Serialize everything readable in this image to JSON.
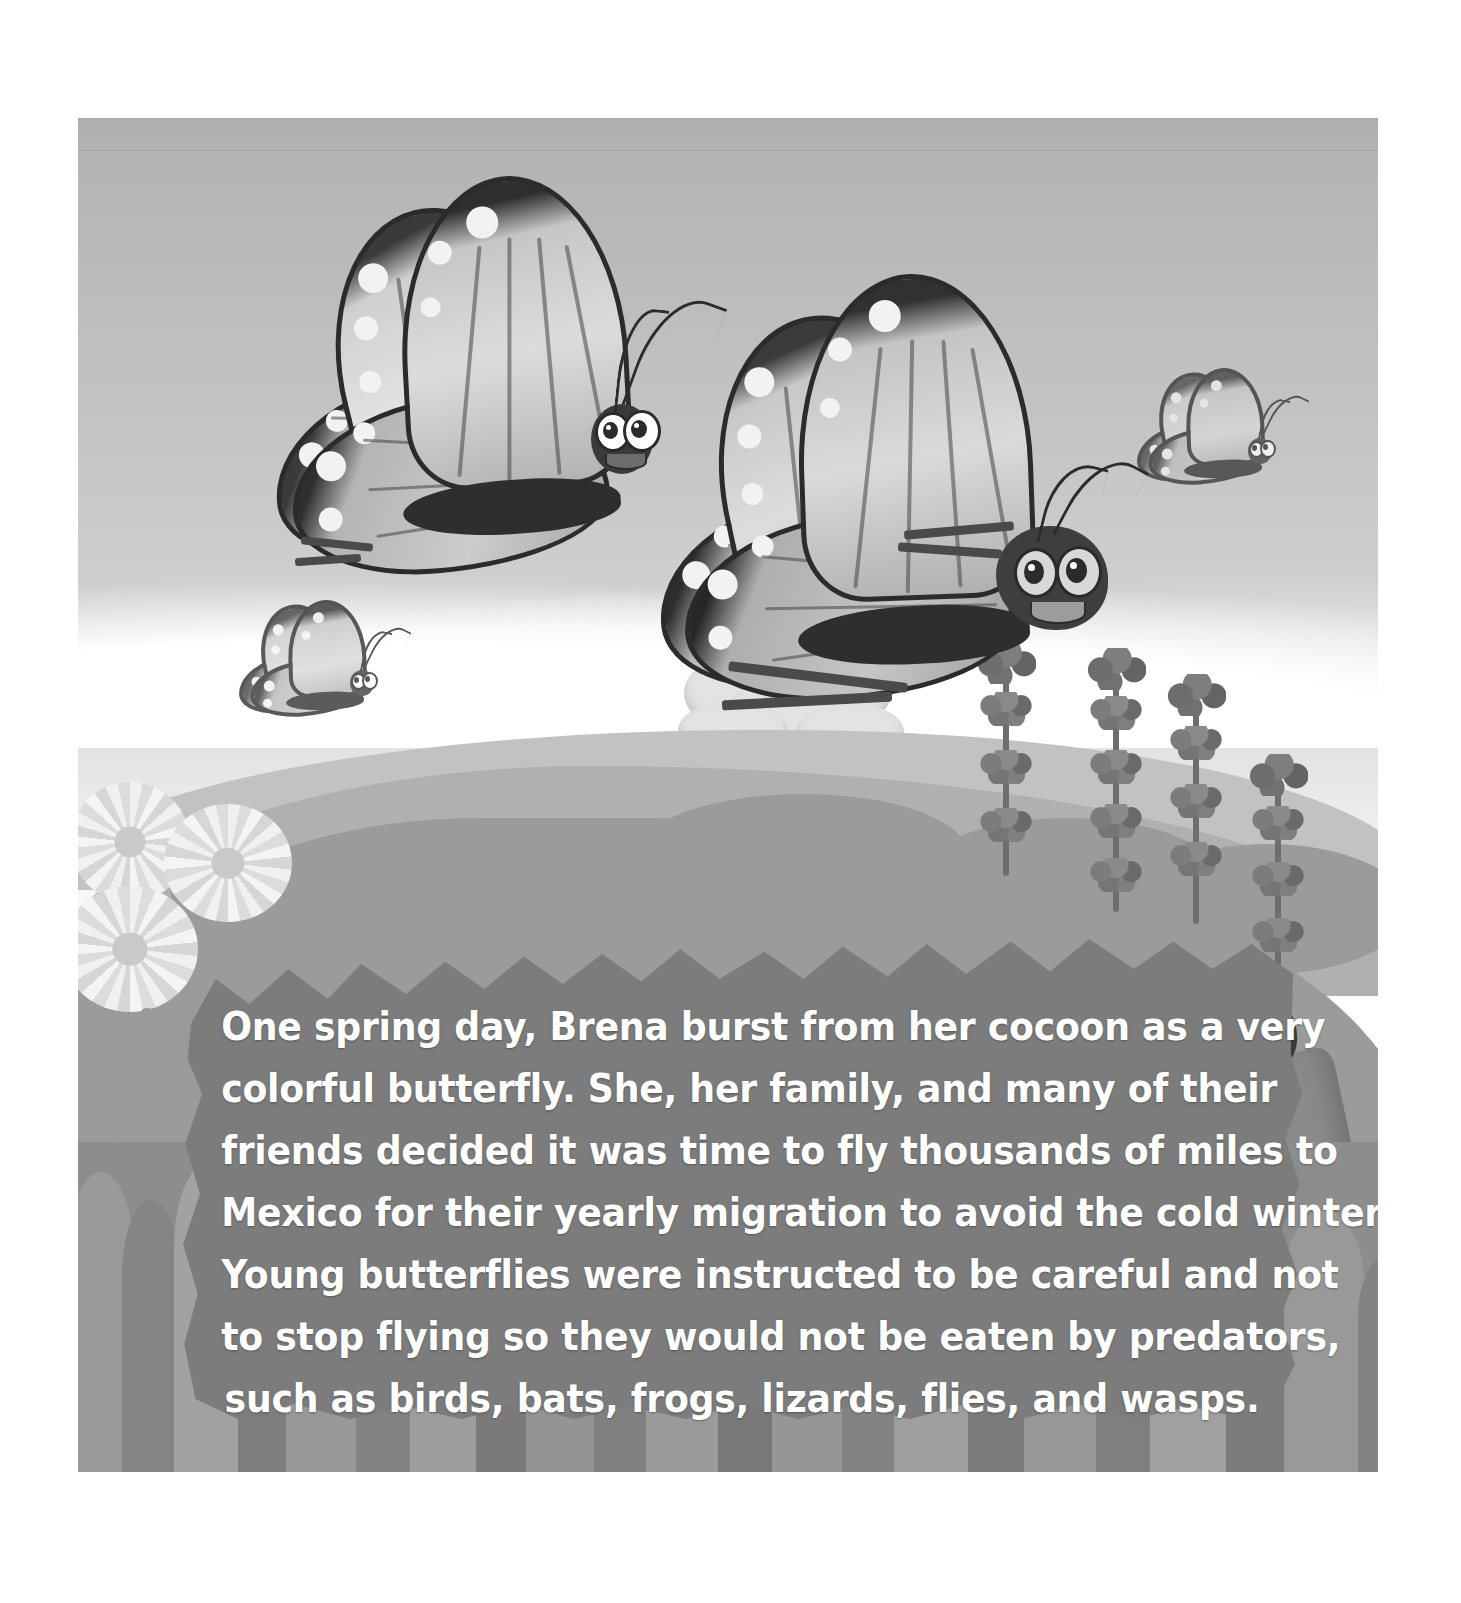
{
  "page": {
    "type": "childrens-picture-book-page",
    "canvas_width": 1461,
    "canvas_height": 1603,
    "background_color": "#ffffff"
  },
  "illustration": {
    "name": "butterfly-migration-scene",
    "frame": {
      "x": 78,
      "y": 118,
      "width": 1300,
      "height": 1354
    },
    "sky": {
      "label": "sky",
      "gradient_top": "#aeaeae",
      "gradient_bottom": "#ffffff"
    },
    "clouds": {
      "label": "cloud band",
      "color": "#ffffff"
    },
    "tree": {
      "label": "puffy tree",
      "foliage_color": "#e3e3e3",
      "trunk_color": "#d2d2d2"
    },
    "hills": [
      {
        "label": "far hill",
        "color": "#c2c2c2"
      },
      {
        "label": "middle hill",
        "color": "#b0b0b0"
      },
      {
        "label": "near hill",
        "color": "#9b9b9b"
      }
    ],
    "grass": {
      "label": "foreground grass",
      "color": "#8d8d8d"
    },
    "plants": [
      {
        "label": "lavender stalk 1"
      },
      {
        "label": "lavender stalk 2"
      },
      {
        "label": "lavender stalk 3"
      },
      {
        "label": "lavender stalk 4"
      }
    ],
    "flowers": [
      {
        "label": "daisy left upper"
      },
      {
        "label": "daisy left middle"
      },
      {
        "label": "daisy left lower"
      },
      {
        "label": "small white flower right"
      }
    ],
    "butterflies": [
      {
        "label": "butterfly large left",
        "name": "brena-friend",
        "size": "large"
      },
      {
        "label": "butterfly large right",
        "name": "brena",
        "size": "large"
      },
      {
        "label": "butterfly small lower left",
        "size": "small"
      },
      {
        "label": "butterfly small upper right",
        "size": "small"
      }
    ]
  },
  "story": {
    "panel_color": "#7c7c7c",
    "text_color": "#ffffff",
    "lines": [
      "One spring day, Brena burst from her cocoon as a very",
      "colorful butterfly. She, her family, and many of their",
      "friends decided it was time to fly thousands of miles to",
      "Mexico for their yearly migration to avoid the cold winter.",
      "Young butterflies were instructed to be careful and not",
      "to stop flying so they would not be eaten by predators,",
      "such as birds, bats, frogs, lizards, flies, and wasps."
    ],
    "full_text": "One spring day, Brena burst from her cocoon as a very colorful butterfly. She, her family, and many of their friends decided it was time to fly thousands of miles to Mexico for their yearly migration to avoid the cold winter. Young butterflies were instructed to be careful and not to stop flying so they would not be eaten by predators, such as birds, bats, frogs, lizards, flies, and wasps."
  }
}
